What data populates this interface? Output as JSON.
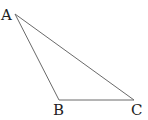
{
  "diagram": {
    "type": "triangle",
    "vertices": [
      {
        "label": "A",
        "x": 15,
        "y": 14
      },
      {
        "label": "B",
        "x": 59,
        "y": 100
      },
      {
        "label": "C",
        "x": 134,
        "y": 100
      }
    ],
    "edges": [
      [
        "A",
        "B"
      ],
      [
        "B",
        "C"
      ],
      [
        "A",
        "C"
      ]
    ],
    "colors": {
      "line": "#6a6a6a",
      "text": "#222222",
      "background": "#ffffff"
    }
  }
}
